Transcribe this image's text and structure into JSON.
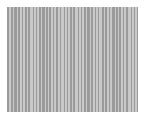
{
  "figure": {
    "kind": "barcode-stripe-pattern",
    "canvas": {
      "width": 145,
      "height": 123,
      "background_color": "#ffffff"
    },
    "plot_area": {
      "x": 7,
      "y": 7,
      "width": 131,
      "height": 105,
      "margin_top": 7,
      "margin_left": 7,
      "margin_right": 7,
      "margin_bottom": 11
    },
    "palette": {
      "dark_stripe": "#9a9a9a",
      "light_stripe": "#c9c9c9",
      "background": "#ffffff"
    }
  },
  "chart_data": {
    "type": "bar",
    "title": "",
    "subtitle": "",
    "xlabel": "",
    "ylabel": "",
    "grid": false,
    "legend": null,
    "orientation": "vertical-stripes",
    "note": "Each value is the pixel width of one vertical stripe, alternating between the dark and light stripe colors starting with a dark stripe at the left edge of the plot area. All stripes run the full height of the plot area.",
    "colors": [
      "#9a9a9a",
      "#c9c9c9"
    ],
    "categories": [
      "s1",
      "s2",
      "s3",
      "s4",
      "s5",
      "s6",
      "s7",
      "s8",
      "s9",
      "s10",
      "s11",
      "s12",
      "s13",
      "s14",
      "s15",
      "s16",
      "s17",
      "s18",
      "s19",
      "s20",
      "s21",
      "s22",
      "s23",
      "s24",
      "s25",
      "s26",
      "s27",
      "s28",
      "s29",
      "s30",
      "s31",
      "s32",
      "s33",
      "s34",
      "s35",
      "s36",
      "s37",
      "s38",
      "s39",
      "s40",
      "s41",
      "s42",
      "s43",
      "s44",
      "s45",
      "s46",
      "s47",
      "s48",
      "s49",
      "s50",
      "s51",
      "s52",
      "s53",
      "s54",
      "s55",
      "s56",
      "s57",
      "s58",
      "s59",
      "s60",
      "s61",
      "s62",
      "s63",
      "s64",
      "s65",
      "s66",
      "s67",
      "s68",
      "s69",
      "s70",
      "s71",
      "s72",
      "s73",
      "s74",
      "s75",
      "s76",
      "s77",
      "s78",
      "s79",
      "s80",
      "s81",
      "s82",
      "s83",
      "s84",
      "s85",
      "s86"
    ],
    "values": [
      2,
      2,
      2,
      1,
      3,
      1,
      2,
      2,
      1,
      2,
      2,
      1,
      2,
      3,
      1,
      2,
      1,
      2,
      2,
      1,
      3,
      1,
      2,
      1,
      2,
      2,
      1,
      2,
      2,
      2,
      1,
      3,
      1,
      2,
      1,
      2,
      2,
      1,
      2,
      3,
      1,
      2,
      1,
      2,
      2,
      1,
      3,
      1,
      2,
      2,
      1,
      2,
      1,
      3,
      2,
      1,
      2,
      2,
      1,
      2,
      3,
      1,
      2,
      1,
      2,
      2,
      1,
      2,
      2,
      3,
      1,
      2,
      1,
      2,
      2,
      1,
      3,
      1,
      2,
      2,
      1,
      2,
      2,
      1,
      3,
      2
    ],
    "ylim": [
      0,
      105
    ],
    "xlim": [
      0,
      131
    ]
  }
}
